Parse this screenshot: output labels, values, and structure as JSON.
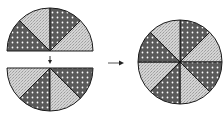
{
  "diagram": {
    "colors": {
      "dark": "#5a5a5a",
      "light": "#cfcfcf",
      "dots": "#ffffff",
      "stroke": "#1a1a1a"
    },
    "top_semicircle": {
      "cx": 50,
      "cy": 51,
      "r": 43,
      "sectors": [
        "dark",
        "light",
        "dark",
        "light"
      ]
    },
    "bottom_semicircle": {
      "cx": 50,
      "cy": 68,
      "r": 43,
      "sectors": [
        "light",
        "dark",
        "light",
        "dark"
      ]
    },
    "full_circle": {
      "cx": 180,
      "cy": 62,
      "r": 42,
      "sectors": [
        "dark",
        "light",
        "dark",
        "light",
        "dark",
        "light",
        "dark",
        "light"
      ]
    },
    "arrows": [
      {
        "from": [
          50,
          57
        ],
        "to": [
          50,
          64
        ],
        "direction": "down"
      },
      {
        "from": [
          108,
          63
        ],
        "to": [
          124,
          63
        ],
        "direction": "right"
      }
    ]
  }
}
